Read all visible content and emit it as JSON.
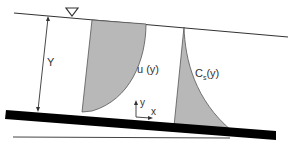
{
  "diagram": {
    "labels": {
      "depth": "Y",
      "velocity": "u (y)",
      "concentration_main": "C",
      "concentration_sub": "s",
      "concentration_arg": "(y)",
      "axis_y": "y",
      "axis_x": "x"
    },
    "symbols": {
      "water_surface": "inverted-triangle"
    },
    "colors": {
      "fill": "#b8b8b8",
      "line": "#333333",
      "bed": "#000000"
    }
  }
}
